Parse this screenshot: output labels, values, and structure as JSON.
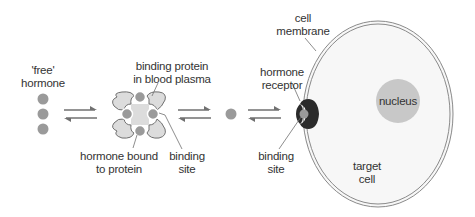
{
  "labels": {
    "free_hormone": [
      "'free'",
      "hormone"
    ],
    "binding_protein": [
      "binding protein",
      "in blood plasma"
    ],
    "hormone_bound": [
      "hormone bound",
      "to protein"
    ],
    "binding_site_protein": [
      "binding",
      "site"
    ],
    "hormone_receptor": [
      "hormone",
      "receptor"
    ],
    "binding_site_receptor": [
      "binding",
      "site"
    ],
    "cell_membrane": [
      "cell",
      "membrane"
    ],
    "nucleus": "nucleus",
    "target_cell": [
      "target",
      "cell"
    ]
  },
  "equilibria": [
    {
      "from": "free hormone",
      "to": "hormone bound to protein",
      "symbol": "reversible-arrows"
    },
    {
      "from": "hormone bound to protein",
      "to": "single free hormone",
      "symbol": "reversible-arrows"
    },
    {
      "from": "single free hormone",
      "to": "hormone receptor",
      "symbol": "reversible-arrows"
    }
  ],
  "colors": {
    "hormone": "#9a9a9a",
    "protein_fill": "#dcdcdc",
    "protein_stroke": "#707070",
    "receptor": "#2b2b2b",
    "cell_fill": "#f7f7f7",
    "membrane_stroke": "#8a8a8a",
    "nucleus": "#c8c8c8",
    "text": "#333333"
  }
}
